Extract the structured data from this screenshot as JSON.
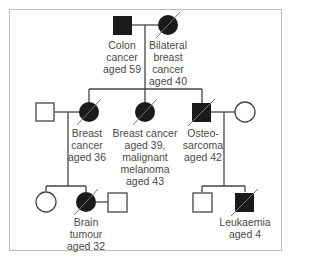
{
  "diagram": {
    "type": "pedigree",
    "colors": {
      "affected": "#1a1a1a",
      "line": "#444444",
      "text": "#4a4a4a",
      "border": "#bdbdbd"
    },
    "individuals": [
      {
        "id": "g1m",
        "generation": 1,
        "sex": "male",
        "affected": true,
        "deceased": false,
        "label": [
          "Colon",
          "cancer",
          "aged 59"
        ]
      },
      {
        "id": "g1f",
        "generation": 1,
        "sex": "female",
        "affected": true,
        "deceased": true,
        "label": [
          "Bilateral",
          "breast",
          "cancer",
          "aged 40"
        ]
      },
      {
        "id": "g2m1",
        "generation": 2,
        "sex": "male",
        "affected": false,
        "deceased": false,
        "label": []
      },
      {
        "id": "g2f1",
        "generation": 2,
        "sex": "female",
        "affected": true,
        "deceased": true,
        "label": [
          "Breast",
          "cancer",
          "aged 36"
        ]
      },
      {
        "id": "g2f2",
        "generation": 2,
        "sex": "female",
        "affected": true,
        "deceased": true,
        "label": [
          "Breast cancer",
          "aged 39,",
          "malignant",
          "melanoma",
          "aged 43"
        ]
      },
      {
        "id": "g2m2",
        "generation": 2,
        "sex": "male",
        "affected": true,
        "deceased": true,
        "label": [
          "Osteo-",
          "sarcoma",
          "aged 42"
        ]
      },
      {
        "id": "g2f3",
        "generation": 2,
        "sex": "female",
        "affected": false,
        "deceased": false,
        "label": []
      },
      {
        "id": "g3f1",
        "generation": 3,
        "sex": "female",
        "affected": false,
        "deceased": false,
        "label": []
      },
      {
        "id": "g3f2",
        "generation": 3,
        "sex": "female",
        "affected": true,
        "deceased": true,
        "label": [
          "Brain",
          "tumour",
          "aged 32"
        ]
      },
      {
        "id": "g3m1",
        "generation": 3,
        "sex": "male",
        "affected": false,
        "deceased": false,
        "label": []
      },
      {
        "id": "g3m2",
        "generation": 3,
        "sex": "male",
        "affected": false,
        "deceased": false,
        "label": []
      },
      {
        "id": "g3m3",
        "generation": 3,
        "sex": "male",
        "affected": true,
        "deceased": true,
        "label": [
          "Leukaemia",
          "aged 4"
        ]
      }
    ],
    "labels": {
      "colon": "Colon\ncancer\naged 59",
      "bilateral": "Bilateral\nbreast\ncancer\naged 40",
      "breast36": "Breast\ncancer\naged 36",
      "breast39": "Breast cancer\naged 39,\nmalignant\nmelanoma\naged 43",
      "osteo": "Osteo-\nsarcoma\naged 42",
      "brain": "Brain\ntumour\naged 32",
      "leuk": "Leukaemia\naged 4"
    }
  }
}
